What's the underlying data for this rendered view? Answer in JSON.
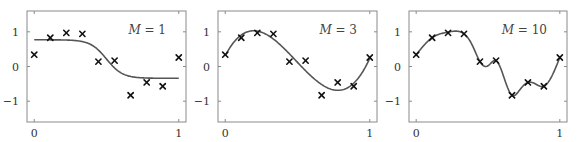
{
  "chart_data": [
    {
      "type": "line",
      "title": "",
      "annotation_prefix": "M",
      "annotation_value": "1",
      "annotation_text": "M = 1",
      "xlabel": "",
      "ylabel": "",
      "xlim": [
        -0.05,
        1.05
      ],
      "ylim": [
        -1.6,
        1.6
      ],
      "xticks": [
        0,
        1
      ],
      "xtick_labels": [
        "0",
        "1"
      ],
      "yticks": [
        -1,
        0,
        1
      ],
      "ytick_labels": [
        "−1",
        "0",
        "1"
      ],
      "grid": false,
      "points": {
        "x": [
          0,
          0.111,
          0.222,
          0.333,
          0.444,
          0.556,
          0.667,
          0.778,
          0.889,
          1
        ],
        "y": [
          0.34,
          0.83,
          0.97,
          0.94,
          0.14,
          0.17,
          -0.83,
          -0.46,
          -0.57,
          0.26
        ]
      },
      "fit": {
        "kind": "sigmoid",
        "high": 0.77,
        "low": -0.34,
        "center": 0.5,
        "steepness": 18
      }
    },
    {
      "type": "line",
      "title": "",
      "annotation_prefix": "M",
      "annotation_value": "3",
      "annotation_text": "M = 3",
      "xlabel": "",
      "ylabel": "",
      "xlim": [
        -0.05,
        1.05
      ],
      "ylim": [
        -1.6,
        1.6
      ],
      "xticks": [
        0,
        1
      ],
      "xtick_labels": [
        "0",
        "1"
      ],
      "yticks": [
        -1,
        0,
        1
      ],
      "ytick_labels": [
        "−1",
        "0",
        "1"
      ],
      "grid": false,
      "points": {
        "x": [
          0,
          0.111,
          0.222,
          0.333,
          0.444,
          0.556,
          0.667,
          0.778,
          0.889,
          1
        ],
        "y": [
          0.34,
          0.83,
          0.97,
          0.94,
          0.14,
          0.17,
          -0.83,
          -0.46,
          -0.57,
          0.26
        ]
      },
      "fit": {
        "kind": "polynomial",
        "coefficients": [
          0.31,
          7.99,
          -25.43,
          17.37
        ]
      }
    },
    {
      "type": "line",
      "title": "",
      "annotation_prefix": "M",
      "annotation_value": "10",
      "annotation_text": "M = 10",
      "xlabel": "",
      "ylabel": "",
      "xlim": [
        -0.05,
        1.05
      ],
      "ylim": [
        -1.6,
        1.6
      ],
      "xticks": [
        0,
        1
      ],
      "xtick_labels": [
        "0",
        "1"
      ],
      "yticks": [
        -1,
        0,
        1
      ],
      "ytick_labels": [
        "−1",
        "0",
        "1"
      ],
      "grid": false,
      "points": {
        "x": [
          0,
          0.111,
          0.222,
          0.333,
          0.444,
          0.556,
          0.667,
          0.778,
          0.889,
          1
        ],
        "y": [
          0.34,
          0.83,
          0.97,
          0.94,
          0.14,
          0.17,
          -0.83,
          -0.46,
          -0.57,
          0.26
        ]
      },
      "fit": {
        "kind": "interpolating-spline",
        "x": [
          0,
          0.111,
          0.222,
          0.333,
          0.39,
          0.444,
          0.5,
          0.556,
          0.667,
          0.72,
          0.778,
          0.83,
          0.889,
          1
        ],
        "y": [
          0.34,
          0.83,
          0.99,
          0.94,
          0.62,
          0.14,
          0.02,
          0.17,
          -0.83,
          -0.68,
          -0.46,
          -0.5,
          -0.57,
          0.26
        ]
      }
    }
  ]
}
